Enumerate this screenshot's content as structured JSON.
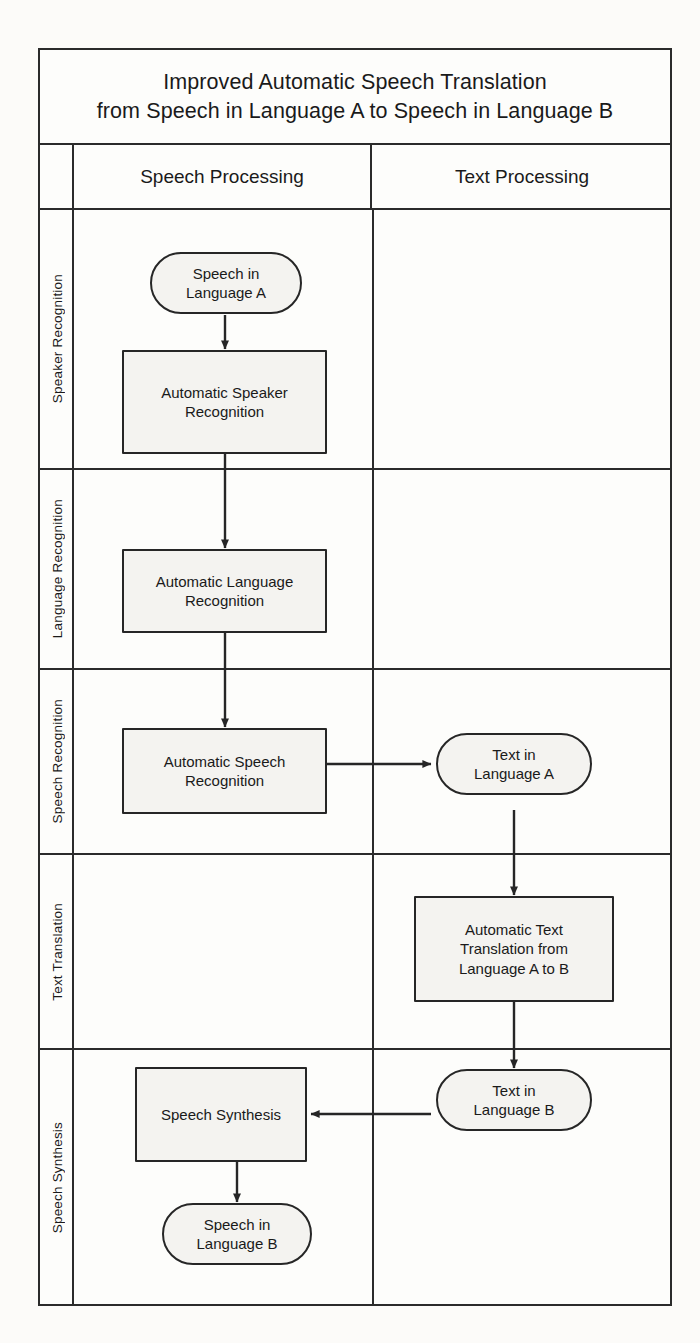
{
  "title": {
    "line1": "Improved Automatic Speech Translation",
    "line2": "from Speech in Language A to Speech in Language B"
  },
  "columns": [
    {
      "id": "speech-processing",
      "label": "Speech Processing"
    },
    {
      "id": "text-processing",
      "label": "Text Processing"
    }
  ],
  "stages": [
    {
      "id": "speaker-recognition",
      "label": "Speaker Recognition"
    },
    {
      "id": "language-recognition",
      "label": "Language Recognition"
    },
    {
      "id": "speech-recognition",
      "label": "Speech Recognition"
    },
    {
      "id": "text-translation",
      "label": "Text Translation"
    },
    {
      "id": "speech-synthesis",
      "label": "Speech Synthesis"
    }
  ],
  "nodes": [
    {
      "id": "speech-in-a",
      "shape": "terminator",
      "column": "speech-processing",
      "stage": "speaker-recognition",
      "text": "Speech in\nLanguage A"
    },
    {
      "id": "automatic-speaker-recognition",
      "shape": "process",
      "column": "speech-processing",
      "stage": "speaker-recognition",
      "text": "Automatic Speaker\nRecognition"
    },
    {
      "id": "automatic-language-recognition",
      "shape": "process",
      "column": "speech-processing",
      "stage": "language-recognition",
      "text": "Automatic Language\nRecognition"
    },
    {
      "id": "automatic-speech-recognition",
      "shape": "process",
      "column": "speech-processing",
      "stage": "speech-recognition",
      "text": "Automatic Speech\nRecognition"
    },
    {
      "id": "text-in-a",
      "shape": "terminator",
      "column": "text-processing",
      "stage": "speech-recognition",
      "text": "Text in\nLanguage A"
    },
    {
      "id": "automatic-text-translation",
      "shape": "process",
      "column": "text-processing",
      "stage": "text-translation",
      "text": "Automatic Text\nTranslation from\nLanguage A to B"
    },
    {
      "id": "text-in-b",
      "shape": "terminator",
      "column": "text-processing",
      "stage": "speech-synthesis",
      "text": "Text in\nLanguage B"
    },
    {
      "id": "speech-synthesis-node",
      "shape": "process",
      "column": "speech-processing",
      "stage": "speech-synthesis",
      "text": "Speech Synthesis"
    },
    {
      "id": "speech-in-b",
      "shape": "terminator",
      "column": "speech-processing",
      "stage": "speech-synthesis",
      "text": "Speech in\nLanguage B"
    }
  ],
  "edges": [
    {
      "from": "speech-in-a",
      "to": "automatic-speaker-recognition",
      "direction": "down"
    },
    {
      "from": "automatic-speaker-recognition",
      "to": "automatic-language-recognition",
      "direction": "down"
    },
    {
      "from": "automatic-language-recognition",
      "to": "automatic-speech-recognition",
      "direction": "down"
    },
    {
      "from": "automatic-speech-recognition",
      "to": "text-in-a",
      "direction": "right"
    },
    {
      "from": "text-in-a",
      "to": "automatic-text-translation",
      "direction": "down"
    },
    {
      "from": "automatic-text-translation",
      "to": "text-in-b",
      "direction": "down"
    },
    {
      "from": "text-in-b",
      "to": "speech-synthesis-node",
      "direction": "left"
    },
    {
      "from": "speech-synthesis-node",
      "to": "speech-in-b",
      "direction": "down"
    }
  ],
  "colors": {
    "stroke": "#262626",
    "node_fill": "#f4f3f0",
    "page": "#fcfbf9"
  }
}
